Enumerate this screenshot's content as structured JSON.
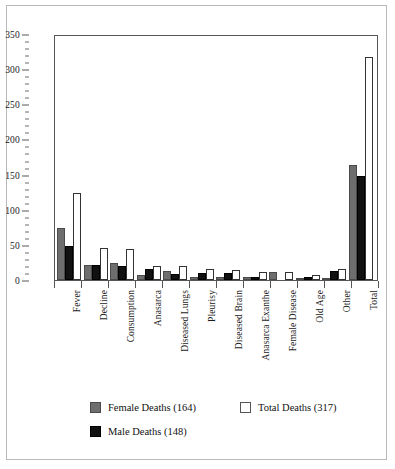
{
  "chart_data": {
    "type": "bar",
    "title": "",
    "xlabel": "",
    "ylabel": "",
    "ylim": [
      0,
      350
    ],
    "ytick_step": 50,
    "yminor_step": 10,
    "grid": false,
    "legend_position": "bottom-left",
    "categories": [
      "Fever",
      "Decline",
      "Consumption",
      "Anasarca",
      "Diseased Lungs",
      "Pleurisy",
      "Diseased Brain",
      "Anasarca Exanthe",
      "Female Disease",
      "Old Age",
      "Other",
      "Total"
    ],
    "ytick_labels": [
      "0",
      "50",
      "100",
      "150",
      "200",
      "250",
      "300",
      "350"
    ],
    "series": [
      {
        "name": "Female Deaths (164)",
        "short_name": "Female Deaths",
        "total": 164,
        "color": "#6e6e6e",
        "values": [
          74,
          22,
          24,
          7,
          13,
          5,
          4,
          5,
          12,
          3,
          1,
          164
        ]
      },
      {
        "name": "Male Deaths (148)",
        "short_name": "Male Deaths",
        "total": 148,
        "color": "#111111",
        "values": [
          48,
          22,
          20,
          15,
          9,
          10,
          10,
          4,
          0,
          4,
          13,
          148
        ]
      },
      {
        "name": "Total Deaths (317)",
        "short_name": "Total Deaths",
        "total": 317,
        "color": "#ffffff",
        "values": [
          124,
          45,
          44,
          20,
          20,
          15,
          14,
          11,
          12,
          7,
          15,
          317
        ]
      }
    ]
  },
  "legend": {
    "items": [
      {
        "label": "Female Deaths (164)",
        "swatch": "female"
      },
      {
        "label": "Total Deaths (317)",
        "swatch": "total"
      },
      {
        "label": "Male Deaths (148)",
        "swatch": "male"
      }
    ]
  }
}
